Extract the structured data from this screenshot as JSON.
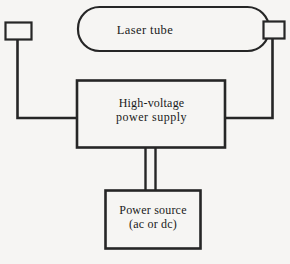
{
  "diagram": {
    "background_color": "#f6f5f3",
    "line_color": "#262626",
    "nodes": {
      "laser_tube": {
        "label": "Laser tube",
        "shape": "rounded-tube"
      },
      "high_voltage_power_supply": {
        "label_line1": "High-voltage",
        "label_line2": "power supply",
        "shape": "rectangle"
      },
      "power_source": {
        "label_line1": "Power source",
        "label_line2": "(ac or dc)",
        "shape": "rectangle"
      },
      "left_electrode": {
        "label": "",
        "shape": "small-rectangle"
      },
      "right_electrode": {
        "label": "",
        "shape": "small-rectangle"
      }
    },
    "connections": [
      {
        "name": "left-electrode-to-supply",
        "from": "left_electrode",
        "to": "high_voltage_power_supply",
        "style": "single-line"
      },
      {
        "name": "right-electrode-to-supply",
        "from": "right_electrode",
        "to": "high_voltage_power_supply",
        "style": "single-line"
      },
      {
        "name": "supply-to-power-source",
        "from": "high_voltage_power_supply",
        "to": "power_source",
        "style": "double-line"
      }
    ]
  }
}
